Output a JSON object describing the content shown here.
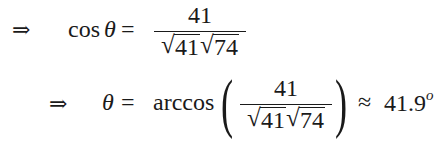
{
  "equations": [
    {
      "implies": "⇒",
      "lhs_func": "cos",
      "lhs_var": "θ",
      "equals": "=",
      "fraction": {
        "numerator": "41",
        "denominator_roots": [
          "41",
          "74"
        ]
      }
    },
    {
      "implies": "⇒",
      "lhs_var": "θ",
      "equals": "=",
      "func": "arccos",
      "paren_open": "(",
      "paren_close": ")",
      "fraction": {
        "numerator": "41",
        "denominator_roots": [
          "41",
          "74"
        ]
      },
      "approx": "≈",
      "result": "41.9",
      "degree": "o"
    }
  ]
}
